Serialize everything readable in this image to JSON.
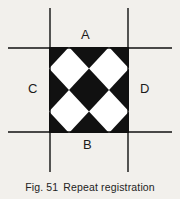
{
  "figure": {
    "caption_number": "Fig. 51",
    "caption_text": "Repeat registration",
    "background_color": "#f2f0ec",
    "ink_color": "#111111",
    "paper_color": "#ffffff"
  },
  "labels": {
    "top": "A",
    "bottom": "B",
    "left": "C",
    "right": "D"
  },
  "diagram": {
    "pattern_name": "repeat-registration-diamond-checker",
    "square": {
      "x": 49,
      "y": 47,
      "width": 80,
      "height": 86
    },
    "cells_across": 2,
    "cells_down": 2,
    "register_lines": {
      "vertical_x": [
        50,
        128
      ],
      "vertical_y_start": 8,
      "vertical_y_end": 172,
      "horizontal_y": [
        48,
        132
      ],
      "horizontal_x_start": 8,
      "horizontal_x_end": 172,
      "line_width": 1.4
    }
  }
}
